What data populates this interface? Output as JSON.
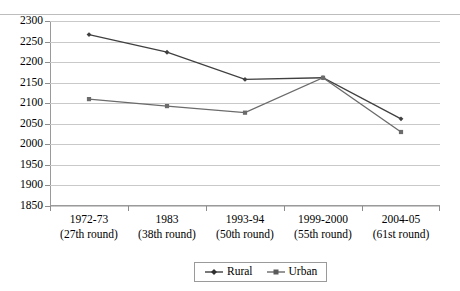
{
  "chart_data": {
    "type": "line",
    "title": "",
    "xlabel": "",
    "ylabel": "",
    "ylim": [
      1850,
      2300
    ],
    "ytick_step": 50,
    "yticks": [
      2300,
      2250,
      2200,
      2150,
      2100,
      2050,
      2000,
      1950,
      1900,
      1850
    ],
    "grid": true,
    "legend_position": "bottom-center",
    "categories": [
      "1972-73",
      "1983",
      "1993-94",
      "1999-2000",
      "2004-05"
    ],
    "category_sublabels": [
      "(27th round)",
      "(38th round)",
      "(50th round)",
      "(55th round)",
      "(61st round)"
    ],
    "series": [
      {
        "name": "Rural",
        "color": "#404040",
        "marker": "diamond",
        "values": [
          2267,
          2224,
          2158,
          2162,
          2062
        ]
      },
      {
        "name": "Urban",
        "color": "#6b6b6b",
        "marker": "square",
        "values": [
          2110,
          2093,
          2077,
          2162,
          2030
        ]
      }
    ]
  },
  "legend": {
    "items": [
      {
        "label": "Rural"
      },
      {
        "label": "Urban"
      }
    ]
  },
  "colors": {
    "rural": "#404040",
    "urban": "#6b6b6b",
    "grid": "#c9c9c9",
    "axis": "#9a9a9a",
    "background": "#ffffff"
  }
}
